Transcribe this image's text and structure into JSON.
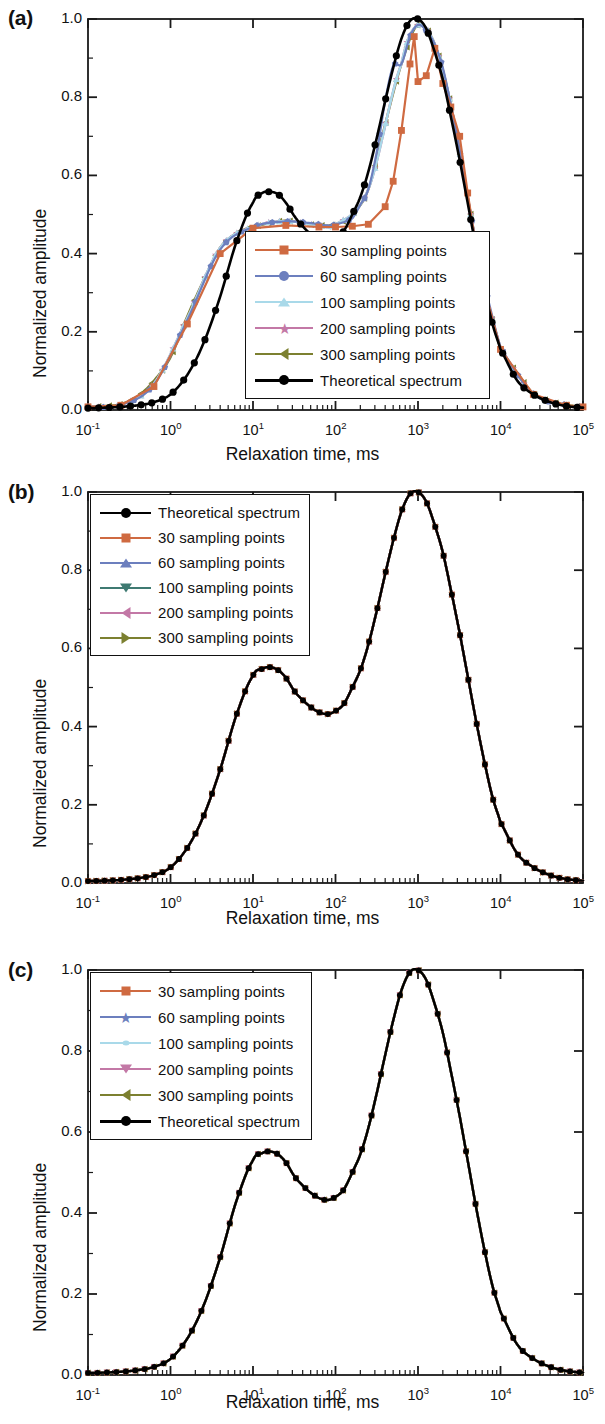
{
  "figure": {
    "panels": [
      {
        "id": "a",
        "label": "(a)"
      },
      {
        "id": "b",
        "label": "(b)"
      },
      {
        "id": "c",
        "label": "(c)"
      }
    ]
  },
  "axes": {
    "xlabel": "Relaxation time, ms",
    "ylabel": "Normalized amplitude",
    "ytick_labels": [
      "1.0",
      "0.8",
      "0.6",
      "0.4",
      "0.2",
      "0.0"
    ],
    "ytick_values": [
      1.0,
      0.8,
      0.6,
      0.4,
      0.2,
      0.0
    ],
    "xtick_labels": [
      "10",
      "10",
      "10",
      "10",
      "10",
      "10",
      "10"
    ],
    "xtick_exponents": [
      "-1",
      "0",
      "1",
      "2",
      "3",
      "4",
      "5"
    ],
    "xlim": [
      -1,
      5
    ],
    "ylim": [
      0,
      1.0
    ],
    "grid": false
  },
  "colors": {
    "s30": "#cf6a41",
    "s60": "#6c7fbe",
    "s100_a": "#a9d9e9",
    "s100_b": "#3f7a72",
    "s200": "#c378a6",
    "s300": "#7c8030",
    "theoretical": "#000000",
    "axis": "#1a1a1a"
  },
  "legends": {
    "panel_a": {
      "position": "inside-center",
      "entries": [
        {
          "label": "30 sampling points",
          "color_key": "s30",
          "marker": "square"
        },
        {
          "label": "60 sampling points",
          "color_key": "s60",
          "marker": "pentagon"
        },
        {
          "label": "100 sampling points",
          "color_key": "s100_a",
          "marker": "triangle-up"
        },
        {
          "label": "200 sampling points",
          "color_key": "s200",
          "marker": "star"
        },
        {
          "label": "300 sampling points",
          "color_key": "s300",
          "marker": "triangle-left"
        },
        {
          "label": "Theoretical  spectrum",
          "color_key": "theoretical",
          "marker": "circle"
        }
      ]
    },
    "panel_b": {
      "position": "top-left",
      "entries": [
        {
          "label": "Theoretical  spectrum",
          "color_key": "theoretical",
          "marker": "circle"
        },
        {
          "label": "30 sampling points",
          "color_key": "s30",
          "marker": "square"
        },
        {
          "label": "60 sampling points",
          "color_key": "s60",
          "marker": "triangle-up"
        },
        {
          "label": "100 sampling points",
          "color_key": "s100_b",
          "marker": "triangle-down"
        },
        {
          "label": "200 sampling points",
          "color_key": "s200",
          "marker": "triangle-left"
        },
        {
          "label": "300 sampling points",
          "color_key": "s300",
          "marker": "triangle-right"
        }
      ]
    },
    "panel_c": {
      "position": "top-left",
      "entries": [
        {
          "label": "30 sampling points",
          "color_key": "s30",
          "marker": "square"
        },
        {
          "label": "60 sampling points",
          "color_key": "s60",
          "marker": "star"
        },
        {
          "label": "100 sampling points",
          "color_key": "s100_a",
          "marker": "dot-small"
        },
        {
          "label": "200 sampling points",
          "color_key": "s200",
          "marker": "triangle-down"
        },
        {
          "label": "300 sampling points",
          "color_key": "s300",
          "marker": "triangle-left"
        },
        {
          "label": "Theoretical  spectrum",
          "color_key": "theoretical",
          "marker": "circle"
        }
      ]
    }
  },
  "chart_data": [
    {
      "panel": "a",
      "type": "line",
      "title": "",
      "xlabel": "Relaxation time, ms",
      "ylabel": "Normalized amplitude",
      "xscale": "log",
      "xlim": [
        0.1,
        100000
      ],
      "ylim": [
        0,
        1.0
      ],
      "grid": false,
      "description": "Inverted spectra for different sampling-point counts vs theoretical bimodal spectrum; low counts distort the spectrum.",
      "series": [
        {
          "name": "Theoretical  spectrum",
          "color": "#000000",
          "marker": "circle",
          "x": [
            0.1,
            0.16,
            0.25,
            0.4,
            0.63,
            1,
            1.6,
            2.5,
            4,
            6.3,
            10,
            13,
            16,
            20,
            25,
            32,
            40,
            50,
            63,
            80,
            100,
            126,
            160,
            200,
            250,
            320,
            400,
            500,
            630,
            800,
            1000,
            1260,
            1600,
            2000,
            2500,
            3200,
            4000,
            5000,
            6300,
            8000,
            10000,
            16000,
            25000,
            40000,
            63000,
            100000
          ],
          "y": [
            0.005,
            0.006,
            0.008,
            0.012,
            0.02,
            0.04,
            0.09,
            0.17,
            0.29,
            0.43,
            0.53,
            0.555,
            0.558,
            0.552,
            0.53,
            0.495,
            0.47,
            0.45,
            0.437,
            0.432,
            0.44,
            0.458,
            0.5,
            0.545,
            0.61,
            0.7,
            0.79,
            0.875,
            0.95,
            0.995,
            1.0,
            0.975,
            0.915,
            0.845,
            0.75,
            0.64,
            0.53,
            0.42,
            0.315,
            0.22,
            0.155,
            0.075,
            0.04,
            0.02,
            0.01,
            0.006
          ]
        },
        {
          "name": "30 sampling points",
          "color": "#cf6a41",
          "marker": "square",
          "x": [
            0.1,
            0.25,
            0.63,
            1.6,
            4,
            10,
            25,
            63,
            100,
            160,
            250,
            400,
            500,
            630,
            800,
            900,
            1000,
            1260,
            1600,
            2000,
            2500,
            3200,
            4000,
            5000,
            6300,
            10000,
            25000,
            63000,
            100000
          ],
          "y": [
            0.008,
            0.012,
            0.06,
            0.22,
            0.4,
            0.465,
            0.472,
            0.468,
            0.468,
            0.47,
            0.475,
            0.52,
            0.585,
            0.715,
            0.885,
            0.955,
            0.84,
            0.855,
            0.925,
            0.835,
            0.775,
            0.7,
            0.555,
            0.425,
            0.315,
            0.155,
            0.04,
            0.012,
            0.008
          ]
        },
        {
          "name": "60 sampling points",
          "color": "#6c7fbe",
          "marker": "pentagon",
          "x": [
            0.1,
            0.25,
            0.63,
            1.6,
            4,
            10,
            25,
            50,
            80,
            100,
            160,
            200,
            250,
            320,
            400,
            500,
            630,
            800,
            1000,
            1260,
            1600,
            2000,
            2500,
            3200,
            4000,
            5000,
            6300,
            10000,
            25000,
            63000,
            100000
          ],
          "y": [
            0.008,
            0.013,
            0.065,
            0.23,
            0.41,
            0.468,
            0.482,
            0.478,
            0.472,
            0.475,
            0.49,
            0.525,
            0.565,
            0.665,
            0.79,
            0.88,
            0.885,
            0.955,
            0.985,
            0.97,
            0.935,
            0.875,
            0.78,
            0.665,
            0.545,
            0.43,
            0.32,
            0.16,
            0.042,
            0.013,
            0.008
          ]
        },
        {
          "name": "100 sampling points",
          "color": "#a9d9e9",
          "marker": "triangle-up",
          "x": [
            0.1,
            0.25,
            0.63,
            1.6,
            4,
            10,
            25,
            63,
            100,
            250,
            630,
            1000,
            1600,
            2500,
            4000,
            6300,
            10000,
            25000,
            63000,
            100000
          ],
          "y": [
            0.008,
            0.013,
            0.068,
            0.235,
            0.415,
            0.468,
            0.483,
            0.472,
            0.475,
            0.565,
            0.885,
            0.985,
            0.935,
            0.78,
            0.545,
            0.32,
            0.16,
            0.042,
            0.013,
            0.008
          ]
        },
        {
          "name": "200 sampling points",
          "color": "#c378a6",
          "marker": "star",
          "x": [
            0.1,
            0.25,
            0.63,
            1.6,
            4,
            10,
            25,
            63,
            100,
            250,
            630,
            1000,
            1600,
            2500,
            4000,
            6300,
            10000,
            25000,
            63000,
            100000
          ],
          "y": [
            0.008,
            0.013,
            0.068,
            0.235,
            0.415,
            0.468,
            0.483,
            0.472,
            0.475,
            0.565,
            0.885,
            0.985,
            0.935,
            0.78,
            0.545,
            0.32,
            0.16,
            0.042,
            0.013,
            0.008
          ]
        },
        {
          "name": "300 sampling points",
          "color": "#7c8030",
          "marker": "triangle-left",
          "x": [
            0.1,
            0.16,
            0.25,
            0.4,
            0.63,
            1,
            1.6,
            2.5,
            4,
            6.3,
            10,
            16,
            25,
            40,
            63,
            100,
            160,
            250,
            400,
            630,
            1000,
            1600,
            2500,
            4000,
            6300,
            10000,
            16000,
            25000,
            40000,
            63000,
            100000
          ],
          "y": [
            0.008,
            0.01,
            0.015,
            0.035,
            0.075,
            0.135,
            0.24,
            0.33,
            0.415,
            0.452,
            0.468,
            0.478,
            0.484,
            0.478,
            0.472,
            0.475,
            0.5,
            0.565,
            0.73,
            0.885,
            0.985,
            0.935,
            0.78,
            0.545,
            0.32,
            0.16,
            0.095,
            0.042,
            0.022,
            0.013,
            0.008
          ]
        }
      ]
    },
    {
      "panel": "b",
      "type": "line",
      "title": "",
      "xlabel": "Relaxation time, ms",
      "ylabel": "Normalized amplitude",
      "xscale": "log",
      "xlim": [
        0.1,
        100000
      ],
      "ylim": [
        0,
        1.0
      ],
      "grid": false,
      "description": "All sampling-point counts reproduce the theoretical bimodal spectrum; curves overlap exactly.",
      "shared_curve": {
        "x": [
          0.1,
          0.16,
          0.25,
          0.4,
          0.63,
          1,
          1.6,
          2.5,
          4,
          6.3,
          10,
          13,
          16,
          20,
          25,
          32,
          40,
          50,
          63,
          80,
          100,
          126,
          160,
          200,
          250,
          320,
          400,
          500,
          630,
          800,
          1000,
          1260,
          1600,
          2000,
          2500,
          3200,
          4000,
          5000,
          6300,
          8000,
          10000,
          16000,
          25000,
          40000,
          63000,
          100000
        ],
        "y": [
          0.005,
          0.006,
          0.008,
          0.012,
          0.02,
          0.04,
          0.09,
          0.17,
          0.29,
          0.43,
          0.53,
          0.548,
          0.552,
          0.545,
          0.525,
          0.49,
          0.468,
          0.45,
          0.437,
          0.432,
          0.44,
          0.458,
          0.5,
          0.545,
          0.61,
          0.7,
          0.79,
          0.875,
          0.95,
          0.995,
          1.0,
          0.975,
          0.915,
          0.845,
          0.75,
          0.64,
          0.53,
          0.42,
          0.315,
          0.22,
          0.155,
          0.075,
          0.04,
          0.02,
          0.01,
          0.006
        ]
      },
      "series": [
        {
          "name": "Theoretical  spectrum",
          "color": "#000000",
          "marker": "circle"
        },
        {
          "name": "30 sampling points",
          "color": "#cf6a41",
          "marker": "square"
        },
        {
          "name": "60 sampling points",
          "color": "#6c7fbe",
          "marker": "triangle-up"
        },
        {
          "name": "100 sampling points",
          "color": "#3f7a72",
          "marker": "triangle-down"
        },
        {
          "name": "200 sampling points",
          "color": "#c378a6",
          "marker": "triangle-left"
        },
        {
          "name": "300 sampling points",
          "color": "#7c8030",
          "marker": "triangle-right"
        }
      ]
    },
    {
      "panel": "c",
      "type": "line",
      "title": "",
      "xlabel": "Relaxation time, ms",
      "ylabel": "Normalized amplitude",
      "xscale": "log",
      "xlim": [
        0.1,
        100000
      ],
      "ylim": [
        0,
        1.0
      ],
      "grid": false,
      "description": "All curves coincide with the theoretical bimodal spectrum; only the black theoretical curve is visible.",
      "shared_curve": {
        "x": [
          0.1,
          0.16,
          0.25,
          0.4,
          0.63,
          1,
          1.6,
          2.5,
          4,
          6.3,
          10,
          13,
          16,
          20,
          25,
          32,
          40,
          50,
          63,
          80,
          100,
          126,
          160,
          200,
          250,
          320,
          400,
          500,
          630,
          800,
          1000,
          1260,
          1600,
          2000,
          2500,
          3200,
          4000,
          5000,
          6300,
          8000,
          10000,
          16000,
          25000,
          40000,
          63000,
          100000
        ],
        "y": [
          0.005,
          0.006,
          0.008,
          0.012,
          0.02,
          0.04,
          0.09,
          0.17,
          0.29,
          0.43,
          0.53,
          0.548,
          0.552,
          0.545,
          0.525,
          0.49,
          0.468,
          0.45,
          0.437,
          0.432,
          0.44,
          0.458,
          0.5,
          0.545,
          0.61,
          0.7,
          0.79,
          0.875,
          0.95,
          0.995,
          1.0,
          0.975,
          0.915,
          0.845,
          0.75,
          0.64,
          0.53,
          0.42,
          0.315,
          0.22,
          0.155,
          0.075,
          0.04,
          0.02,
          0.01,
          0.006
        ]
      },
      "series": [
        {
          "name": "30 sampling points",
          "color": "#cf6a41",
          "marker": "square"
        },
        {
          "name": "60 sampling points",
          "color": "#6c7fbe",
          "marker": "star"
        },
        {
          "name": "100 sampling points",
          "color": "#a9d9e9",
          "marker": "dot-small"
        },
        {
          "name": "200 sampling points",
          "color": "#c378a6",
          "marker": "triangle-down"
        },
        {
          "name": "300 sampling points",
          "color": "#7c8030",
          "marker": "triangle-left"
        },
        {
          "name": "Theoretical  spectrum",
          "color": "#000000",
          "marker": "circle"
        }
      ]
    }
  ]
}
